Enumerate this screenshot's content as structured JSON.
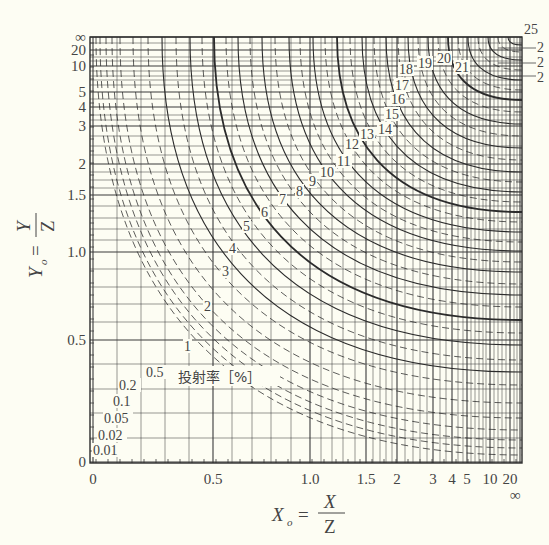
{
  "chart_data": {
    "type": "line",
    "title": "",
    "subtitle": "投射率 [%]",
    "xlabel": "X_o = X / Z",
    "ylabel": "Y_o = Y / Z",
    "x_axis": {
      "scale": "nonlinear (compressed toward ∞)",
      "ticks": [
        "0",
        "0.5",
        "1.0",
        "1.5",
        "2",
        "3",
        "4",
        "5",
        "10",
        "20",
        "∞"
      ],
      "tick_positions_px": [
        93,
        213,
        310,
        366,
        397,
        433,
        452,
        467,
        490,
        510,
        520
      ]
    },
    "y_axis": {
      "scale": "nonlinear (compressed toward ∞)",
      "ticks": [
        "∞",
        "20",
        "10",
        "5",
        "4",
        "3",
        "2",
        "1.5",
        "1.0",
        "0.5",
        "0"
      ],
      "tick_positions_px": [
        37,
        50,
        66,
        92,
        107,
        126,
        164,
        195,
        252,
        340,
        462
      ]
    },
    "grid": true,
    "legend": "none (contour labels placed along curves)",
    "series_kind": "iso-contours of projection ratio (%) — solid and dashed curves",
    "contour_levels_percent": [
      0.01,
      0.02,
      0.05,
      0.1,
      0.2,
      0.5,
      1,
      2,
      3,
      4,
      5,
      6,
      7,
      8,
      9,
      10,
      11,
      12,
      13,
      14,
      15,
      16,
      17,
      18,
      19,
      20,
      21,
      22,
      23,
      24,
      25
    ],
    "annotations": [
      {
        "text": "0.01",
        "x_px": 93,
        "y_px": 455
      },
      {
        "text": "0.02",
        "x_px": 98,
        "y_px": 440
      },
      {
        "text": "0.05",
        "x_px": 104,
        "y_px": 423
      },
      {
        "text": "0.1",
        "x_px": 113,
        "y_px": 406
      },
      {
        "text": "0.2",
        "x_px": 119,
        "y_px": 390
      },
      {
        "text": "0.5",
        "x_px": 146,
        "y_px": 377
      },
      {
        "text": "1",
        "x_px": 184,
        "y_px": 351
      },
      {
        "text": "2",
        "x_px": 204,
        "y_px": 311
      },
      {
        "text": "3",
        "x_px": 222,
        "y_px": 276
      },
      {
        "text": "4",
        "x_px": 229,
        "y_px": 253
      },
      {
        "text": "5",
        "x_px": 243,
        "y_px": 231
      },
      {
        "text": "6",
        "x_px": 261,
        "y_px": 217
      },
      {
        "text": "7",
        "x_px": 279,
        "y_px": 204
      },
      {
        "text": "8",
        "x_px": 296,
        "y_px": 196
      },
      {
        "text": "9",
        "x_px": 309,
        "y_px": 186
      },
      {
        "text": "10",
        "x_px": 320,
        "y_px": 177
      },
      {
        "text": "11",
        "x_px": 337,
        "y_px": 166
      },
      {
        "text": "12",
        "x_px": 345,
        "y_px": 149
      },
      {
        "text": "13",
        "x_px": 360,
        "y_px": 139
      },
      {
        "text": "14",
        "x_px": 378,
        "y_px": 134
      },
      {
        "text": "15",
        "x_px": 385,
        "y_px": 119
      },
      {
        "text": "16",
        "x_px": 391,
        "y_px": 104
      },
      {
        "text": "17",
        "x_px": 395,
        "y_px": 90
      },
      {
        "text": "18",
        "x_px": 399,
        "y_px": 74
      },
      {
        "text": "19",
        "x_px": 418,
        "y_px": 68
      },
      {
        "text": "20",
        "x_px": 437,
        "y_px": 63
      },
      {
        "text": "21",
        "x_px": 455,
        "y_px": 72
      },
      {
        "text": "22",
        "x_px": 537,
        "y_px": 57
      },
      {
        "text": "23",
        "x_px": 537,
        "y_px": 65
      },
      {
        "text": "24",
        "x_px": 537,
        "y_px": 80
      },
      {
        "text": "25",
        "x_px": 526,
        "y_px": 35
      }
    ]
  },
  "labels": {
    "unit_label": "投射率［%］",
    "x_axis_title_main": "X",
    "x_axis_title_sub": "o",
    "x_axis_eq": "=",
    "x_num": "X",
    "x_den": "Z",
    "y_axis_title_main": "Y",
    "y_axis_title_sub": "o",
    "y_axis_eq": "=",
    "y_num": "Y",
    "y_den": "Z",
    "x_inf": "∞",
    "right_labels": [
      "25",
      "2",
      "2",
      "2"
    ]
  },
  "colors": {
    "background": "#fdfdf3",
    "line": "#2b2b2b",
    "grid": "#3a3a3a",
    "text": "#444444"
  }
}
